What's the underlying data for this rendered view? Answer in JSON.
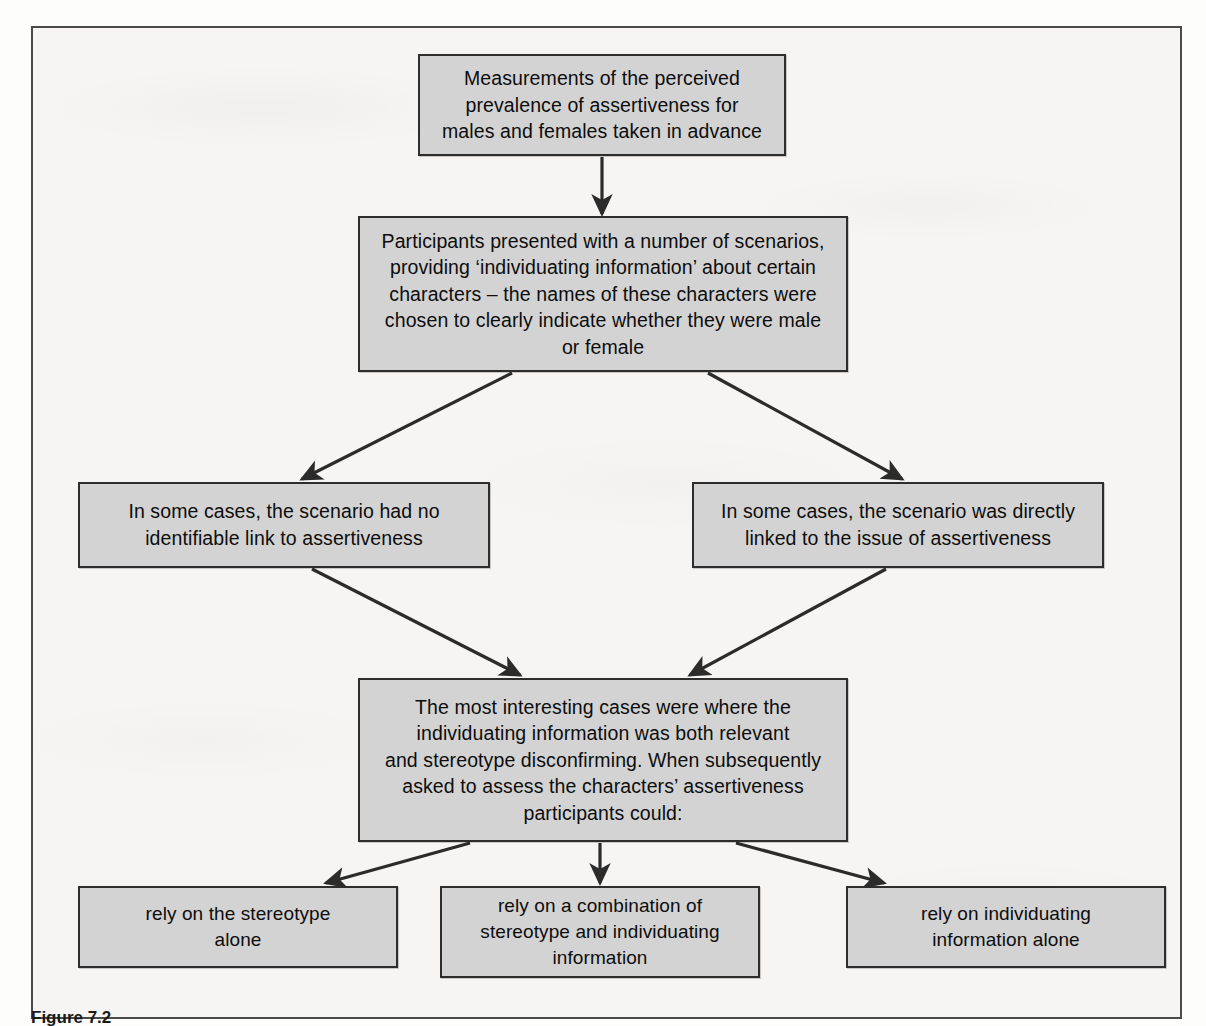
{
  "figure": {
    "background_color": "#f6f5f3",
    "box_fill_color": "#d3d3d3",
    "box_border_color": "#2d2d2d",
    "arrow_color": "#2b2b2b"
  },
  "boxes": {
    "premeasure": "Measurements of the perceived\nprevalence of assertiveness for\nmales and females taken in advance",
    "scenarios": "Participants presented with a number of scenarios,\nproviding ‘individuating information’ about certain\ncharacters – the names of these characters were\nchosen to clearly indicate whether they were male\nor female",
    "no_link": "In some cases, the scenario had no\nidentifiable link to assertiveness",
    "direct_link": "In some cases, the  scenario was directly\nlinked to the issue of assertiveness",
    "most_interesting": "The most interesting cases were where the\nindividuating information was both relevant\nand stereotype disconfirming. When subsequently\nasked to assess the characters’ assertiveness\nparticipants could:",
    "rely_stereotype": "rely on the stereotype\nalone",
    "rely_combination": "rely on a combination of\nstereotype and individuating\ninformation",
    "rely_individuating": "rely on individuating\ninformation alone"
  },
  "caption": {
    "label": "Figure 7.2",
    "text": ""
  }
}
